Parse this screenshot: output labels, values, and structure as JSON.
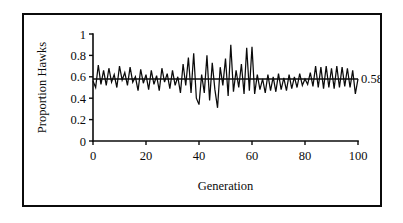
{
  "chart_data": {
    "type": "line",
    "title": "",
    "xlabel": "Generation",
    "ylabel": "Proportion Hawks",
    "xlim": [
      0,
      100
    ],
    "ylim": [
      0,
      1
    ],
    "xticks": [
      "0",
      "20",
      "40",
      "60",
      "80",
      "100"
    ],
    "yticks": [
      "0",
      "0.2",
      "0.4",
      "0.6",
      "0.8",
      "1"
    ],
    "grid": false,
    "legend": "none",
    "annotations": [
      {
        "name": "equilibrium-value-label",
        "text": "0.58",
        "x": 100,
        "y": 0.58
      }
    ],
    "reference_line": {
      "name": "equilibrium-line",
      "orientation": "horizontal",
      "value": 0.58
    },
    "series": [
      {
        "name": "Proportion Hawks",
        "x": [
          0,
          1,
          2,
          3,
          4,
          5,
          6,
          7,
          8,
          9,
          10,
          11,
          12,
          13,
          14,
          15,
          16,
          17,
          18,
          19,
          20,
          21,
          22,
          23,
          24,
          25,
          26,
          27,
          28,
          29,
          30,
          31,
          32,
          33,
          34,
          35,
          36,
          37,
          38,
          39,
          40,
          41,
          42,
          43,
          44,
          45,
          46,
          47,
          48,
          49,
          50,
          51,
          52,
          53,
          54,
          55,
          56,
          57,
          58,
          59,
          60,
          61,
          62,
          63,
          64,
          65,
          66,
          67,
          68,
          69,
          70,
          71,
          72,
          73,
          74,
          75,
          76,
          77,
          78,
          79,
          80,
          81,
          82,
          83,
          84,
          85,
          86,
          87,
          88,
          89,
          90,
          91,
          92,
          93,
          94,
          95,
          96,
          97,
          98,
          99,
          100
        ],
        "values": [
          0.56,
          0.5,
          0.71,
          0.53,
          0.66,
          0.52,
          0.68,
          0.55,
          0.62,
          0.5,
          0.7,
          0.57,
          0.64,
          0.52,
          0.69,
          0.55,
          0.6,
          0.47,
          0.67,
          0.54,
          0.62,
          0.48,
          0.66,
          0.53,
          0.61,
          0.47,
          0.68,
          0.55,
          0.63,
          0.49,
          0.66,
          0.52,
          0.6,
          0.45,
          0.72,
          0.52,
          0.78,
          0.45,
          0.82,
          0.4,
          0.34,
          0.62,
          0.45,
          0.8,
          0.38,
          0.73,
          0.48,
          0.31,
          0.69,
          0.52,
          0.77,
          0.42,
          0.9,
          0.46,
          0.66,
          0.5,
          0.72,
          0.44,
          0.87,
          0.47,
          0.88,
          0.44,
          0.62,
          0.48,
          0.58,
          0.45,
          0.62,
          0.47,
          0.6,
          0.46,
          0.63,
          0.48,
          0.59,
          0.47,
          0.62,
          0.49,
          0.6,
          0.5,
          0.63,
          0.52,
          0.58,
          0.53,
          0.64,
          0.51,
          0.7,
          0.5,
          0.69,
          0.49,
          0.7,
          0.5,
          0.68,
          0.49,
          0.7,
          0.5,
          0.69,
          0.51,
          0.68,
          0.5,
          0.66,
          0.44,
          0.58
        ]
      }
    ]
  }
}
